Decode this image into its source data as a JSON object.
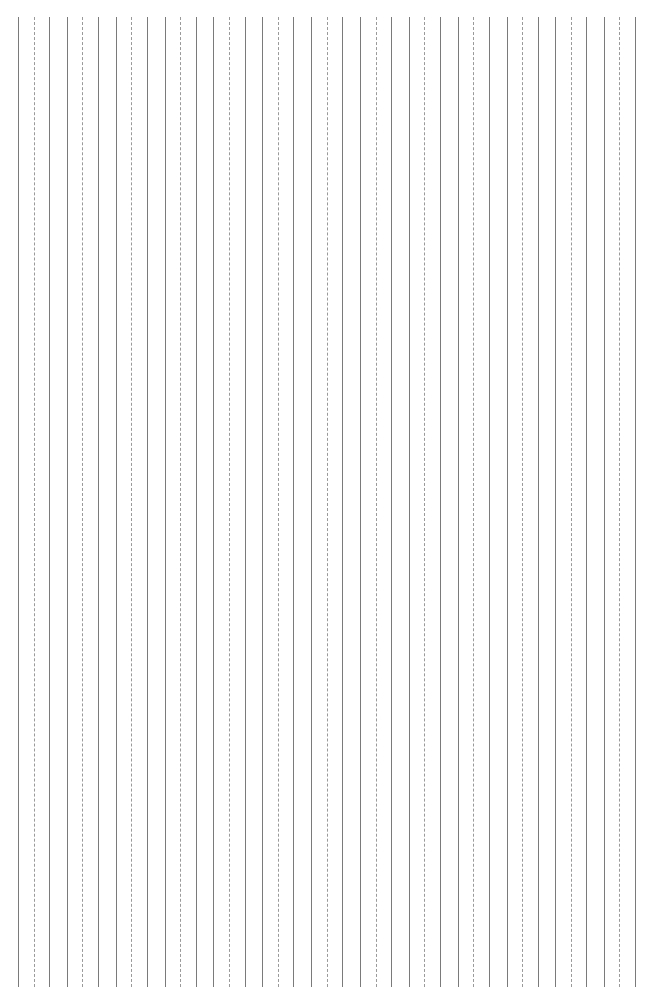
{
  "figure": {
    "type": "vertical-line-pattern",
    "width": 666,
    "height": 987,
    "background_color": "#ffffff",
    "line_top_y": 17,
    "line_bottom_y": 987,
    "group_count": 13,
    "lines_per_group": 3,
    "group_pitch_px": 48.9,
    "intra_group_spacing_px": 15.6,
    "first_line_x": 18,
    "last_line_x": 634,
    "solid_line_color": "#7a7a7a",
    "dotted_line_color": "#9a9a9a",
    "solid_line_width_px": 1,
    "dotted_line_width_px": 1,
    "dash_pattern": "2px on, 2px off",
    "group_line_styles": [
      "solid",
      "dashed",
      "solid"
    ],
    "groups": [
      {
        "index": 1,
        "x_solid_left": 18,
        "x_dashed": 34,
        "x_solid_right": 49
      },
      {
        "index": 2,
        "x_solid_left": 67,
        "x_dashed": 82,
        "x_solid_right": 98
      },
      {
        "index": 3,
        "x_solid_left": 116,
        "x_dashed": 131,
        "x_solid_right": 147
      },
      {
        "index": 4,
        "x_solid_left": 165,
        "x_dashed": 180,
        "x_solid_right": 196
      },
      {
        "index": 5,
        "x_solid_left": 213,
        "x_dashed": 229,
        "x_solid_right": 245
      },
      {
        "index": 6,
        "x_solid_left": 262,
        "x_dashed": 278,
        "x_solid_right": 293
      },
      {
        "index": 7,
        "x_solid_left": 311,
        "x_dashed": 327,
        "x_solid_right": 342
      },
      {
        "index": 8,
        "x_solid_left": 360,
        "x_dashed": 376,
        "x_solid_right": 391
      },
      {
        "index": 9,
        "x_solid_left": 409,
        "x_dashed": 424,
        "x_solid_right": 440
      },
      {
        "index": 10,
        "x_solid_left": 458,
        "x_dashed": 473,
        "x_solid_right": 489
      },
      {
        "index": 11,
        "x_solid_left": 507,
        "x_dashed": 522,
        "x_solid_right": 538
      },
      {
        "index": 12,
        "x_solid_left": 555,
        "x_dashed": 571,
        "x_solid_right": 586
      },
      {
        "index": 13,
        "x_solid_left": 604,
        "x_dashed": 619,
        "x_solid_right": 635
      }
    ]
  }
}
